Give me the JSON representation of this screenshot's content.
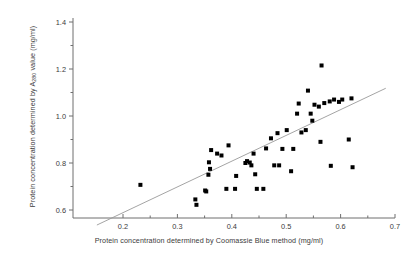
{
  "chart_data": {
    "type": "scatter",
    "title": "",
    "xlabel": "Protein concentration determined by Coomassie Blue method (mg/ml)",
    "ylabel_prefix": "Protein concentration determined by A",
    "ylabel_subscript": "280",
    "ylabel_suffix": " value (mg/ml)",
    "xlim": [
      0.15,
      0.7
    ],
    "ylim": [
      0.52,
      1.43
    ],
    "xticks": [
      0.2,
      0.3,
      0.4,
      0.5,
      0.6,
      0.7
    ],
    "xticklabels": [
      "0.2",
      "0.3",
      "0.4",
      "0.5",
      "0.6",
      "0.7"
    ],
    "xminorticks": [
      0.25,
      0.35,
      0.45,
      0.55,
      0.65
    ],
    "yticks": [
      0.6,
      0.8,
      1.0,
      1.2,
      1.4
    ],
    "yticklabels": [
      "0.6",
      "0.8",
      "1.0",
      "1.2",
      "1.4"
    ],
    "yminorticks": [
      0.7,
      0.9,
      1.1,
      1.3
    ],
    "grid": false,
    "legend": null,
    "marker": "square",
    "marker_color": "#000000",
    "marker_size_px": 4,
    "line_color": "#9a9a9a",
    "axis_color": "#6f6f6f",
    "trendline": {
      "type": "linear-fit",
      "x_start": 0.152,
      "y_start": 0.536,
      "x_end": 0.683,
      "y_end": 1.118
    },
    "points": [
      {
        "x": 0.232,
        "y": 0.707
      },
      {
        "x": 0.333,
        "y": 0.645
      },
      {
        "x": 0.335,
        "y": 0.622
      },
      {
        "x": 0.351,
        "y": 0.683
      },
      {
        "x": 0.353,
        "y": 0.679
      },
      {
        "x": 0.357,
        "y": 0.75
      },
      {
        "x": 0.358,
        "y": 0.803
      },
      {
        "x": 0.36,
        "y": 0.775
      },
      {
        "x": 0.362,
        "y": 0.855
      },
      {
        "x": 0.373,
        "y": 0.84
      },
      {
        "x": 0.381,
        "y": 0.832
      },
      {
        "x": 0.39,
        "y": 0.69
      },
      {
        "x": 0.394,
        "y": 0.875
      },
      {
        "x": 0.406,
        "y": 0.69
      },
      {
        "x": 0.408,
        "y": 0.745
      },
      {
        "x": 0.425,
        "y": 0.8
      },
      {
        "x": 0.428,
        "y": 0.808
      },
      {
        "x": 0.433,
        "y": 0.802
      },
      {
        "x": 0.436,
        "y": 0.79
      },
      {
        "x": 0.44,
        "y": 0.84
      },
      {
        "x": 0.443,
        "y": 0.752
      },
      {
        "x": 0.446,
        "y": 0.69
      },
      {
        "x": 0.458,
        "y": 0.69
      },
      {
        "x": 0.463,
        "y": 0.862
      },
      {
        "x": 0.472,
        "y": 0.905
      },
      {
        "x": 0.478,
        "y": 0.79
      },
      {
        "x": 0.484,
        "y": 0.927
      },
      {
        "x": 0.487,
        "y": 0.79
      },
      {
        "x": 0.493,
        "y": 0.86
      },
      {
        "x": 0.501,
        "y": 0.94
      },
      {
        "x": 0.509,
        "y": 0.765
      },
      {
        "x": 0.513,
        "y": 0.86
      },
      {
        "x": 0.52,
        "y": 1.01
      },
      {
        "x": 0.523,
        "y": 1.053
      },
      {
        "x": 0.528,
        "y": 0.93
      },
      {
        "x": 0.536,
        "y": 0.94
      },
      {
        "x": 0.54,
        "y": 1.108
      },
      {
        "x": 0.545,
        "y": 1.01
      },
      {
        "x": 0.548,
        "y": 0.98
      },
      {
        "x": 0.552,
        "y": 1.048
      },
      {
        "x": 0.56,
        "y": 1.04
      },
      {
        "x": 0.563,
        "y": 0.89
      },
      {
        "x": 0.565,
        "y": 1.215
      },
      {
        "x": 0.57,
        "y": 1.055
      },
      {
        "x": 0.58,
        "y": 1.062
      },
      {
        "x": 0.582,
        "y": 0.788
      },
      {
        "x": 0.588,
        "y": 1.07
      },
      {
        "x": 0.597,
        "y": 1.06
      },
      {
        "x": 0.603,
        "y": 1.07
      },
      {
        "x": 0.615,
        "y": 0.9
      },
      {
        "x": 0.62,
        "y": 1.075
      },
      {
        "x": 0.622,
        "y": 0.782
      }
    ]
  }
}
